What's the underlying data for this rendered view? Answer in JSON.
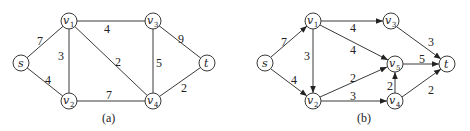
{
  "graph_a": {
    "caption": "(a)",
    "directed": false,
    "nodes": [
      {
        "id": "s",
        "label": "s",
        "sub": "",
        "x": 21,
        "y": 63
      },
      {
        "id": "v1",
        "label": "v",
        "sub": "1",
        "x": 69,
        "y": 21
      },
      {
        "id": "v2",
        "label": "v",
        "sub": "2",
        "x": 69,
        "y": 101
      },
      {
        "id": "v3",
        "label": "v",
        "sub": "3",
        "x": 153,
        "y": 21
      },
      {
        "id": "v4",
        "label": "v",
        "sub": "4",
        "x": 153,
        "y": 101
      },
      {
        "id": "t",
        "label": "t",
        "sub": "",
        "x": 207,
        "y": 63
      }
    ],
    "edges": [
      {
        "from": "s",
        "to": "v1",
        "weight": "7"
      },
      {
        "from": "s",
        "to": "v2",
        "weight": "4"
      },
      {
        "from": "v1",
        "to": "v2",
        "weight": "3"
      },
      {
        "from": "v1",
        "to": "v3",
        "weight": "4"
      },
      {
        "from": "v1",
        "to": "v4",
        "weight": "2"
      },
      {
        "from": "v2",
        "to": "v4",
        "weight": "7"
      },
      {
        "from": "v3",
        "to": "v4",
        "weight": "5"
      },
      {
        "from": "v3",
        "to": "t",
        "weight": "9"
      },
      {
        "from": "v4",
        "to": "t",
        "weight": "2"
      }
    ]
  },
  "graph_b": {
    "caption": "(b)",
    "directed": true,
    "nodes": [
      {
        "id": "s",
        "label": "s",
        "sub": "",
        "x": 265,
        "y": 63
      },
      {
        "id": "v1",
        "label": "v",
        "sub": "1",
        "x": 313,
        "y": 21
      },
      {
        "id": "v2",
        "label": "v",
        "sub": "2",
        "x": 313,
        "y": 101
      },
      {
        "id": "v3",
        "label": "v",
        "sub": "3",
        "x": 391,
        "y": 21
      },
      {
        "id": "v5",
        "label": "v",
        "sub": "5",
        "x": 395,
        "y": 64
      },
      {
        "id": "v4",
        "label": "v",
        "sub": "4",
        "x": 395,
        "y": 101
      },
      {
        "id": "t",
        "label": "t",
        "sub": "",
        "x": 447,
        "y": 64
      }
    ],
    "edges": [
      {
        "from": "s",
        "to": "v1",
        "weight": "7"
      },
      {
        "from": "s",
        "to": "v2",
        "weight": "4"
      },
      {
        "from": "v1",
        "to": "v2",
        "weight": "3"
      },
      {
        "from": "v1",
        "to": "v3",
        "weight": "4"
      },
      {
        "from": "v1",
        "to": "v5",
        "weight": "4"
      },
      {
        "from": "v2",
        "to": "v5",
        "weight": "2"
      },
      {
        "from": "v2",
        "to": "v4",
        "weight": "3"
      },
      {
        "from": "v4",
        "to": "v5",
        "weight": "2"
      },
      {
        "from": "v3",
        "to": "t",
        "weight": "3"
      },
      {
        "from": "v5",
        "to": "t",
        "weight": "5"
      },
      {
        "from": "v4",
        "to": "t",
        "weight": "2"
      }
    ]
  }
}
